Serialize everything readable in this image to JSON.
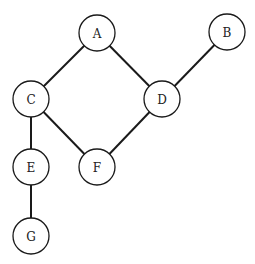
{
  "graph": {
    "type": "undirected",
    "node_radius": 18,
    "nodes": [
      {
        "id": "A",
        "label": "A",
        "x": 97,
        "y": 33
      },
      {
        "id": "B",
        "label": "B",
        "x": 227,
        "y": 32
      },
      {
        "id": "C",
        "label": "C",
        "x": 31,
        "y": 99
      },
      {
        "id": "D",
        "label": "D",
        "x": 162,
        "y": 99
      },
      {
        "id": "E",
        "label": "E",
        "x": 31,
        "y": 167
      },
      {
        "id": "F",
        "label": "F",
        "x": 97,
        "y": 167
      },
      {
        "id": "G",
        "label": "G",
        "x": 31,
        "y": 236
      }
    ],
    "edges": [
      {
        "from": "A",
        "to": "C"
      },
      {
        "from": "A",
        "to": "D"
      },
      {
        "from": "B",
        "to": "D"
      },
      {
        "from": "C",
        "to": "E"
      },
      {
        "from": "C",
        "to": "F"
      },
      {
        "from": "D",
        "to": "F"
      },
      {
        "from": "E",
        "to": "G"
      }
    ]
  },
  "colors": {
    "stroke": "#1a1a1a",
    "fill": "#ffffff",
    "label": "#222222"
  }
}
